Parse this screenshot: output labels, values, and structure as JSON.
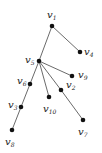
{
  "diagram": {
    "type": "tree",
    "nodes": [
      {
        "id": "v1",
        "name": "v",
        "sub": "1",
        "x": 52,
        "y": 26,
        "lx": 47,
        "ly": 18
      },
      {
        "id": "v4",
        "name": "v",
        "sub": "4",
        "x": 80,
        "y": 52,
        "lx": 84,
        "ly": 55
      },
      {
        "id": "v5",
        "name": "v",
        "sub": "5",
        "x": 39,
        "y": 61,
        "lx": 25,
        "ly": 63
      },
      {
        "id": "v9",
        "name": "v",
        "sub": "9",
        "x": 72,
        "y": 76,
        "lx": 78,
        "ly": 78
      },
      {
        "id": "v6",
        "name": "v",
        "sub": "6",
        "x": 30,
        "y": 84,
        "lx": 17,
        "ly": 84
      },
      {
        "id": "v2",
        "name": "v",
        "sub": "2",
        "x": 61,
        "y": 90,
        "lx": 66,
        "ly": 88
      },
      {
        "id": "v10",
        "name": "v",
        "sub": "10",
        "x": 49,
        "y": 97,
        "lx": 43,
        "ly": 112
      },
      {
        "id": "v3",
        "name": "v",
        "sub": "3",
        "x": 21,
        "y": 107,
        "lx": 8,
        "ly": 108
      },
      {
        "id": "v7",
        "name": "v",
        "sub": "7",
        "x": 83,
        "y": 120,
        "lx": 78,
        "ly": 135
      },
      {
        "id": "v8",
        "name": "v",
        "sub": "8",
        "x": 12,
        "y": 130,
        "lx": 5,
        "ly": 145
      }
    ],
    "edges": [
      [
        "v1",
        "v4"
      ],
      [
        "v1",
        "v5"
      ],
      [
        "v5",
        "v9"
      ],
      [
        "v5",
        "v6"
      ],
      [
        "v5",
        "v2"
      ],
      [
        "v5",
        "v10"
      ],
      [
        "v2",
        "v7"
      ],
      [
        "v6",
        "v3"
      ],
      [
        "v3",
        "v8"
      ]
    ]
  }
}
